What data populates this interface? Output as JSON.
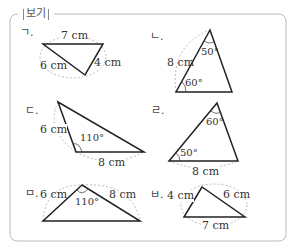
{
  "box": {
    "title": "보기"
  },
  "items": [
    {
      "marker": "ㄱ.",
      "sides": [
        "7 cm",
        "6 cm",
        "4 cm"
      ],
      "angles": []
    },
    {
      "marker": "ㄴ.",
      "sides": [
        "8 cm"
      ],
      "angles": [
        "50°",
        "60°"
      ]
    },
    {
      "marker": "ㄷ.",
      "sides": [
        "6 cm",
        "8 cm"
      ],
      "angles": [
        "110°"
      ]
    },
    {
      "marker": "ㄹ.",
      "sides": [
        "8 cm"
      ],
      "angles": [
        "60°",
        "50°"
      ]
    },
    {
      "marker": "ㅁ.",
      "sides": [
        "6 cm",
        "8 cm"
      ],
      "angles": [
        "110°"
      ]
    },
    {
      "marker": "ㅂ.",
      "sides": [
        "4 cm",
        "6 cm",
        "7 cm"
      ],
      "angles": []
    }
  ],
  "colors": {
    "line": "#222222",
    "dash": "#aaaaaa",
    "frame": "#bbbbbb"
  }
}
